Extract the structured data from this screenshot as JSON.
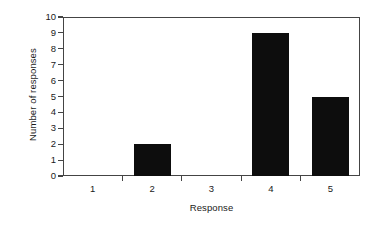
{
  "chart_data": {
    "type": "bar",
    "title": "",
    "subtitle": "",
    "xlabel": "Response",
    "ylabel": "Number of responses",
    "categories": [
      "1",
      "2",
      "3",
      "4",
      "5"
    ],
    "values": [
      0,
      2,
      0,
      9,
      5
    ],
    "ylim": [
      0,
      10
    ],
    "ytick_labels": [
      "0",
      "1",
      "2",
      "3",
      "4",
      "5",
      "6",
      "7",
      "8",
      "9",
      "10"
    ],
    "ytick_values": [
      0,
      1,
      2,
      3,
      4,
      5,
      6,
      7,
      8,
      9,
      10
    ],
    "grid": false,
    "legend": false,
    "legend_position": "none",
    "annotations": [],
    "colors": {
      "bar": "#0d0d0d",
      "axis": "#444444",
      "text": "#1a1a1a",
      "background": "#ffffff"
    }
  }
}
